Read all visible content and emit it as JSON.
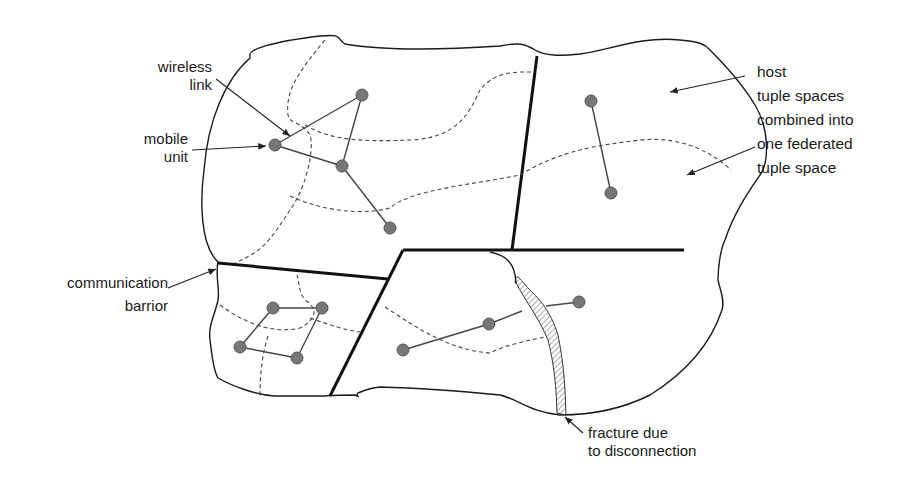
{
  "labels": {
    "wireless_link": "wireless\nlink",
    "mobile_unit": "mobile\nunit",
    "host_tuple": "host\ntuple spaces\ncombined into\none federated\ntuple space",
    "communication_barrier": "communication\nbarrior",
    "fracture": "fracture due\nto disconnection"
  },
  "colors": {
    "node_fill": "#777777",
    "barrier": "#111111",
    "hatch": "#888888"
  },
  "nodes": {
    "top_left_group": [
      [
        275,
        145
      ],
      [
        362,
        95
      ],
      [
        342,
        166
      ],
      [
        390,
        228
      ]
    ],
    "top_right_group": [
      [
        591,
        101
      ],
      [
        611,
        193
      ]
    ],
    "bottom_left_group": [
      [
        273,
        308
      ],
      [
        322,
        308
      ],
      [
        240,
        347
      ],
      [
        297,
        358
      ]
    ],
    "bottom_mid_group": [
      [
        403,
        350
      ],
      [
        489,
        324
      ],
      [
        579,
        302
      ]
    ]
  }
}
